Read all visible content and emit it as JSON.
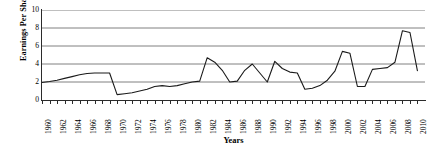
{
  "chart_data": {
    "type": "line",
    "title": "",
    "xlabel": "Years",
    "ylabel": "Earnings Per Share ($)",
    "xlim": [
      1960,
      2011
    ],
    "ylim": [
      0,
      10
    ],
    "yticks": [
      0,
      2,
      4,
      6,
      8,
      10
    ],
    "grid": true,
    "legend": false,
    "x": [
      1960,
      1961,
      1962,
      1963,
      1964,
      1965,
      1966,
      1967,
      1968,
      1969,
      1970,
      1971,
      1972,
      1973,
      1974,
      1975,
      1976,
      1977,
      1978,
      1979,
      1980,
      1981,
      1982,
      1983,
      1984,
      1985,
      1986,
      1987,
      1988,
      1989,
      1990,
      1991,
      1992,
      1993,
      1994,
      1995,
      1996,
      1997,
      1998,
      1999,
      2000,
      2001,
      2002,
      2003,
      2004,
      2005,
      2006,
      2007,
      2008,
      2009,
      2010
    ],
    "series": [
      {
        "name": "Earnings Per Share",
        "values": [
          1.95,
          2.05,
          2.2,
          2.4,
          2.6,
          2.8,
          2.95,
          3.0,
          3.0,
          3.0,
          0.6,
          0.7,
          0.8,
          1.0,
          1.2,
          1.5,
          1.6,
          1.5,
          1.6,
          1.8,
          2.0,
          2.1,
          4.7,
          4.2,
          3.3,
          2.0,
          2.1,
          3.3,
          4.0,
          3.0,
          2.0,
          4.3,
          3.5,
          3.1,
          3.0,
          1.2,
          1.3,
          1.6,
          2.2,
          3.2,
          5.4,
          5.2,
          1.5,
          1.5,
          3.4,
          3.5,
          3.6,
          4.2,
          7.7,
          7.5,
          3.2
        ]
      }
    ],
    "xtick_labels": [
      "1960",
      "1962",
      "1964",
      "1966",
      "1968",
      "1970",
      "1972",
      "1974",
      "1976",
      "1978",
      "1980",
      "1982",
      "1984",
      "1986",
      "1988",
      "1990",
      "1992",
      "1994",
      "1996",
      "1998",
      "2000",
      "2002",
      "2004",
      "2006",
      "2008",
      "2010"
    ],
    "line_color": "#1a1a1a",
    "grid_color": "#808080"
  }
}
